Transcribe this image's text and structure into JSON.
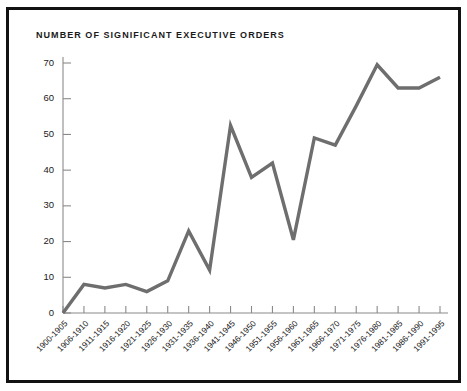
{
  "chart_data": {
    "type": "line",
    "title": "NUMBER OF SIGNIFICANT EXECUTIVE ORDERS",
    "xlabel": "",
    "ylabel": "",
    "categories": [
      "1900-1905",
      "1906-1910",
      "1911-1915",
      "1916-1920",
      "1921-1925",
      "1926-1930",
      "1931-1935",
      "1936-1940",
      "1941-1945",
      "1946-1950",
      "1951-1955",
      "1956-1960",
      "1961-1965",
      "1966-1970",
      "1971-1975",
      "1976-1980",
      "1981-1985",
      "1986-1990",
      "1991-1995"
    ],
    "values": [
      0,
      8,
      7,
      8,
      6,
      9,
      23,
      12,
      52.5,
      38,
      42,
      20.5,
      49,
      47,
      58,
      69.5,
      63,
      63,
      66
    ],
    "ylim": [
      0,
      70
    ],
    "ytick_labels": [
      "0",
      "10",
      "20",
      "30",
      "40",
      "50",
      "60",
      "70"
    ],
    "ytick_values": [
      0,
      10,
      20,
      30,
      40,
      50,
      60,
      70
    ],
    "grid": false,
    "legend": false,
    "legend_position": "none",
    "series_color": "#6e6e6e",
    "axis_color": "#8a8a8a",
    "frame_color": "#121212",
    "background": "#ffffff"
  }
}
